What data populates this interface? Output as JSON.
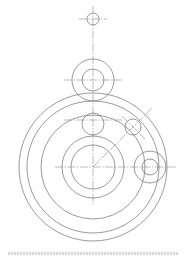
{
  "document": {
    "type": "technical-drawing",
    "subject": "gear train / planetary arrangement layout",
    "caption": ""
  },
  "style": {
    "line_color": "#555555",
    "center_line_color": "#777777",
    "background": "#ffffff"
  },
  "drawing": {
    "main_center": {
      "x": 93,
      "y": 167
    },
    "concentric_circles": [
      {
        "cx": 93,
        "cy": 167,
        "r": 74
      },
      {
        "cx": 93,
        "cy": 167,
        "r": 66
      },
      {
        "cx": 93,
        "cy": 167,
        "r": 52
      },
      {
        "cx": 93,
        "cy": 167,
        "r": 31
      },
      {
        "cx": 93,
        "cy": 167,
        "r": 22
      }
    ],
    "gears": [
      {
        "name": "top-small",
        "cx": 93,
        "cy": 19,
        "radii": [
          6
        ]
      },
      {
        "name": "top-gear",
        "cx": 93,
        "cy": 80,
        "radii": [
          21,
          11
        ]
      },
      {
        "name": "mid-gear",
        "cx": 93,
        "cy": 124,
        "radii": [
          11
        ]
      },
      {
        "name": "diagonal-gear",
        "cx": 133,
        "cy": 127,
        "radii": [
          8
        ]
      },
      {
        "name": "right-gear",
        "cx": 150,
        "cy": 167,
        "radii": [
          16,
          8
        ]
      }
    ],
    "center_lines": [
      {
        "x1": 93,
        "y1": 6,
        "x2": 93,
        "y2": 205
      },
      {
        "x1": 79,
        "y1": 19,
        "x2": 107,
        "y2": 19
      },
      {
        "x1": 64,
        "y1": 80,
        "x2": 122,
        "y2": 80
      },
      {
        "x1": 64,
        "y1": 120,
        "x2": 122,
        "y2": 120
      },
      {
        "x1": 55,
        "y1": 167,
        "x2": 176,
        "y2": 167
      },
      {
        "x1": 93,
        "y1": 167,
        "x2": 153,
        "y2": 107
      },
      {
        "x1": 122,
        "y1": 116,
        "x2": 145,
        "y2": 139
      }
    ]
  }
}
